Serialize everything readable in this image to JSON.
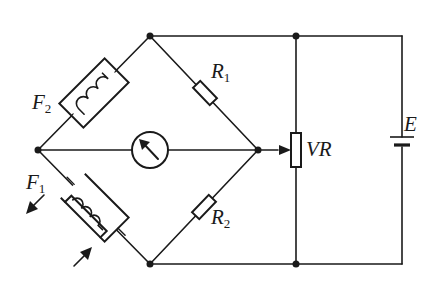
{
  "diagram": {
    "type": "bridge circuit (Wheatstone) with sensing coils",
    "colors": {
      "stroke": "#1a1a1a",
      "background": "#ffffff"
    },
    "components": {
      "F2": {
        "label": "F",
        "sub": "2",
        "kind": "coil-in-box"
      },
      "F1": {
        "label": "F",
        "sub": "1",
        "kind": "coil-in-box with force arrows"
      },
      "R1": {
        "label": "R",
        "sub": "1",
        "kind": "resistor"
      },
      "R2": {
        "label": "R",
        "sub": "2",
        "kind": "resistor"
      },
      "VR": {
        "label": "VR",
        "kind": "variable resistor (potentiometer)"
      },
      "E": {
        "label": "E",
        "kind": "battery"
      },
      "G": {
        "label": "",
        "kind": "galvanometer"
      }
    }
  }
}
